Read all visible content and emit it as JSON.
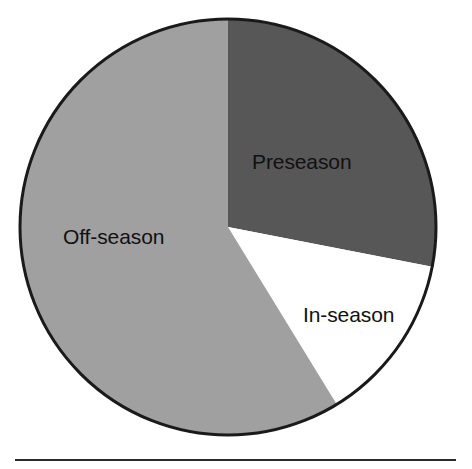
{
  "figure": {
    "background_color": "#ffffff",
    "bottom_rule": {
      "name": "horizontal-rule",
      "color": "#2b2b2b"
    }
  },
  "chart_data": {
    "type": "pie",
    "title": "",
    "subtitle": "",
    "xlabel": "",
    "ylabel": "",
    "grid": false,
    "legend_position": "none",
    "labels_position": "inside-slices",
    "start_angle_deg": 0,
    "direction": "clockwise",
    "center": {
      "x": 228,
      "y": 227
    },
    "radius": 208,
    "outline_color": "#1a1a1a",
    "outline_width": 3,
    "categories": [
      "Preseason",
      "In-season",
      "Off-season"
    ],
    "values": [
      28,
      13,
      59
    ],
    "value_unit": "percent",
    "slices": [
      {
        "label": "Preseason",
        "value": 28,
        "start_angle_deg": 0,
        "end_angle_deg": 101,
        "color": "#575757",
        "text_color": "#111111"
      },
      {
        "label": "In-season",
        "value": 13,
        "start_angle_deg": 101,
        "end_angle_deg": 148.5,
        "color": "#ffffff",
        "text_color": "#111111"
      },
      {
        "label": "Off-season",
        "value": 59,
        "start_angle_deg": 148.5,
        "end_angle_deg": 360,
        "color": "#a0a0a0",
        "text_color": "#111111"
      }
    ]
  }
}
